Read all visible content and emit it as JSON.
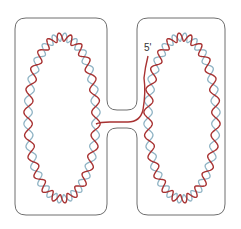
{
  "diagram": {
    "type": "dna-double-helix-loops",
    "labels": {
      "five_prime": "5'"
    },
    "colors": {
      "outline": "#6e6e6e",
      "strand_primary": "#a83232",
      "strand_secondary": "#8fb3c4",
      "background": "#ffffff"
    },
    "loops": [
      {
        "name": "left-loop",
        "cx": 62,
        "cy": 118,
        "rx": 34,
        "ry": 81
      },
      {
        "name": "right-loop",
        "cx": 182,
        "cy": 118,
        "rx": 34,
        "ry": 81
      }
    ]
  }
}
